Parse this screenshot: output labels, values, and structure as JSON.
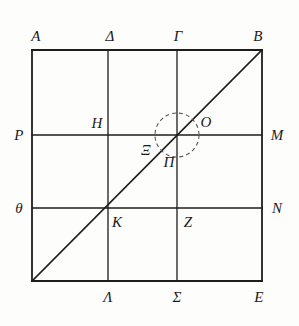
{
  "figure": {
    "kind": "geometry-diagram",
    "stroke_color": "#1d1d1d",
    "dash_color": "#5a5a5a",
    "background_color": "#fdfdfb"
  },
  "frame": {
    "left": 32,
    "top": 50,
    "right": 262,
    "bottom": 281
  },
  "grid": {
    "vertical_lines_x": [
      108,
      177
    ],
    "horizontal_lines_y": [
      135,
      208
    ]
  },
  "diagonal": {
    "x1": 32,
    "y1": 281,
    "x2": 262,
    "y2": 50
  },
  "circle": {
    "cx": 177,
    "cy": 135,
    "r": 22,
    "dash_pattern": "4 3"
  },
  "labels": [
    {
      "id": "A",
      "text": "A",
      "x": 36,
      "y": 36
    },
    {
      "id": "Delta",
      "text": "Δ",
      "x": 110,
      "y": 36
    },
    {
      "id": "Gamma",
      "text": "Γ",
      "x": 178,
      "y": 36
    },
    {
      "id": "B",
      "text": "B",
      "x": 258,
      "y": 36
    },
    {
      "id": "P",
      "text": "P",
      "x": 19,
      "y": 135
    },
    {
      "id": "H",
      "text": "H",
      "x": 97,
      "y": 123
    },
    {
      "id": "Xi",
      "text": "Ξ",
      "x": 146,
      "y": 150
    },
    {
      "id": "O",
      "text": "O",
      "x": 206,
      "y": 122
    },
    {
      "id": "M",
      "text": "M",
      "x": 277,
      "y": 135
    },
    {
      "id": "Pi",
      "text": "Π",
      "x": 169,
      "y": 162
    },
    {
      "id": "theta",
      "text": "θ",
      "x": 19,
      "y": 208
    },
    {
      "id": "K",
      "text": "K",
      "x": 117,
      "y": 222
    },
    {
      "id": "Z",
      "text": "Z",
      "x": 188,
      "y": 222
    },
    {
      "id": "N",
      "text": "N",
      "x": 277,
      "y": 208
    },
    {
      "id": "Lambda",
      "text": "Λ",
      "x": 108,
      "y": 297
    },
    {
      "id": "Sigma",
      "text": "Σ",
      "x": 177,
      "y": 297
    },
    {
      "id": "E",
      "text": "E",
      "x": 259,
      "y": 297
    }
  ]
}
